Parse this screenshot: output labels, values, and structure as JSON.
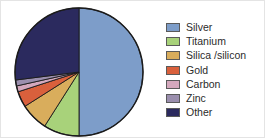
{
  "chart_data": {
    "type": "pie",
    "title": "",
    "legend_position": "right",
    "grid": false,
    "categories": [
      "Silver",
      "Titanium",
      "Silica /silicon",
      "Gold",
      "Carbon",
      "Zinc",
      "Other"
    ],
    "values": [
      50,
      9,
      7,
      4,
      1.5,
      1.5,
      27
    ],
    "unit": "percent",
    "start_angle_deg": 0,
    "direction": "clockwise",
    "colors": [
      "#7d9dc9",
      "#a8d27a",
      "#d9ad5c",
      "#d9603c",
      "#d4a8bd",
      "#9b8fae",
      "#2b2a5e"
    ],
    "slices": [
      {
        "label": "Silver",
        "value": 50,
        "color": "#7d9dc9"
      },
      {
        "label": "Titanium",
        "value": 9,
        "color": "#a8d27a"
      },
      {
        "label": "Silica /silicon",
        "value": 7,
        "color": "#d9ad5c"
      },
      {
        "label": "Gold",
        "value": 4,
        "color": "#d9603c"
      },
      {
        "label": "Carbon",
        "value": 1.5,
        "color": "#d4a8bd"
      },
      {
        "label": "Zinc",
        "value": 1.5,
        "color": "#9b8fae"
      },
      {
        "label": "Other",
        "value": 27,
        "color": "#2b2a5e"
      }
    ],
    "xlabel": "",
    "ylabel": ""
  },
  "legend": {
    "items": [
      {
        "label": "Silver",
        "color": "#7d9dc9",
        "swatch": "legend-swatch-silver"
      },
      {
        "label": "Titanium",
        "color": "#a8d27a",
        "swatch": "legend-swatch-titanium"
      },
      {
        "label": "Silica /silicon",
        "color": "#d9ad5c",
        "swatch": "legend-swatch-silica-silicon"
      },
      {
        "label": "Gold",
        "color": "#d9603c",
        "swatch": "legend-swatch-gold"
      },
      {
        "label": "Carbon",
        "color": "#d4a8bd",
        "swatch": "legend-swatch-carbon"
      },
      {
        "label": "Zinc",
        "color": "#9b8fae",
        "swatch": "legend-swatch-zinc"
      },
      {
        "label": "Other",
        "color": "#2b2a5e",
        "swatch": "legend-swatch-other"
      }
    ]
  },
  "figure": {
    "background_color": "#ffffff",
    "slice_outline_color": "#1b1b1b",
    "legend_swatch_outline_color": "#5a5a5a",
    "text_color": "#2b2b2b"
  }
}
